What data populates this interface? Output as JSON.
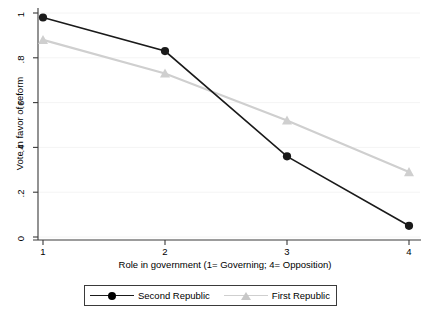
{
  "chart_data": {
    "type": "line",
    "title": "",
    "xlabel": "Role in government (1= Governing; 4= Opposition)",
    "ylabel": "Vote in favor of reform",
    "x": [
      1,
      2,
      3,
      4
    ],
    "categories": [
      "1",
      "2",
      "3",
      "4"
    ],
    "xtick_labels": [
      "1",
      "2",
      "3",
      "4"
    ],
    "ytick_labels": [
      "0",
      ".2",
      ".4",
      ".6",
      ".8",
      "1"
    ],
    "ytick_values": [
      0,
      0.2,
      0.4,
      0.6,
      0.8,
      1
    ],
    "xlim": [
      1,
      4
    ],
    "ylim": [
      0,
      1
    ],
    "grid": "horizontal-faint",
    "legend_position": "bottom-center",
    "series": [
      {
        "name": "Second Republic",
        "values": [
          0.98,
          0.83,
          0.36,
          0.05
        ],
        "color": "#1a1a1a",
        "marker": "circle"
      },
      {
        "name": "First Republic",
        "values": [
          0.88,
          0.73,
          0.52,
          0.29
        ],
        "color": "#cfcfcf",
        "marker": "triangle"
      }
    ]
  },
  "axes": {
    "y_title": "Vote in favor of reform",
    "x_title": "Role in government (1= Governing; 4= Opposition)",
    "y_ticks": [
      {
        "label": "1"
      },
      {
        "label": ".8"
      },
      {
        "label": ".6"
      },
      {
        "label": ".4"
      },
      {
        "label": ".2"
      },
      {
        "label": "0"
      }
    ],
    "x_ticks": [
      {
        "label": "1"
      },
      {
        "label": "2"
      },
      {
        "label": "3"
      },
      {
        "label": "4"
      }
    ]
  },
  "legend": {
    "entries": [
      {
        "label": "Second Republic"
      },
      {
        "label": "First Republic"
      }
    ]
  },
  "colors": {
    "series_second_republic": "#1a1a1a",
    "series_first_republic": "#cfcfcf",
    "axis": "#3a3a3a",
    "grid": "#f2f2f2",
    "background": "#ffffff"
  }
}
